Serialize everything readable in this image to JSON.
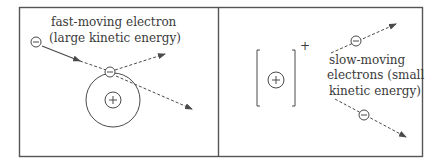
{
  "colors": {
    "line": "#4a4a4a",
    "frame": "#555555",
    "text": "#3a3a3a",
    "background": "#ffffff"
  },
  "left_panel": {
    "label_line1": "fast-moving electron",
    "label_line2": "(large kinetic energy)",
    "incoming_electron_symbol": "⊖",
    "bound_electron_symbol": "⊖",
    "nucleus_symbol": "+"
  },
  "right_panel": {
    "ion_charge": "+",
    "nucleus_symbol": "+",
    "label_line1": "slow-moving",
    "label_line2": "electrons (small",
    "label_line3": "kinetic energy)",
    "electron_symbol": "⊖"
  }
}
